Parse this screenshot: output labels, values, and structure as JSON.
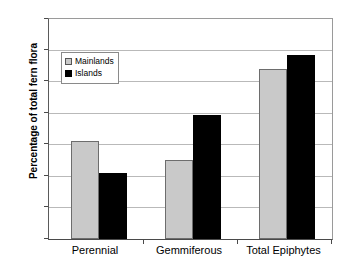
{
  "chart_data": {
    "type": "bar",
    "title": "",
    "xlabel": "",
    "ylabel": "Percentage of total fern flora",
    "categories": [
      "Perennial",
      "Gemmiferous",
      "Total Epiphytes"
    ],
    "series": [
      {
        "name": "Mainlands",
        "values": [
          15.6,
          12.6,
          27.1
        ],
        "color": "#c9c9c9"
      },
      {
        "name": "Islands",
        "values": [
          10.5,
          19.7,
          29.2
        ],
        "color": "#000000"
      }
    ],
    "ylim": [
      0,
      35
    ],
    "ytick_step": 5,
    "ytick_labels": [
      "0",
      "5",
      "10",
      "15",
      "20",
      "25",
      "30",
      "35"
    ],
    "grid": true,
    "legend_position": "upper-left",
    "legend_entries": [
      "Mainlands",
      "Islands"
    ]
  },
  "axis": {
    "y_title": "Percentage of total fern flora",
    "y_ticks": [
      "35",
      "30",
      "25",
      "20",
      "15",
      "10",
      "5",
      "0"
    ],
    "x_categories": [
      "Perennial",
      "Gemmiferous",
      "Total Epiphytes"
    ]
  },
  "legend": {
    "items": [
      {
        "label": "Mainlands",
        "swatch": "light-gray-square"
      },
      {
        "label": "Islands",
        "swatch": "black-square"
      }
    ]
  }
}
